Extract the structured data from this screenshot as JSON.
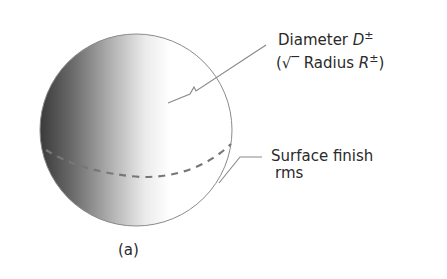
{
  "figure": {
    "caption": "(a)",
    "colors": {
      "outline": "#8a8a8a",
      "shade_dark": "#3c3c3c",
      "shade_light": "#ffffff",
      "dash": "#7a7a7a",
      "text": "#2a2a2a"
    },
    "sphere": {
      "center_x": 136,
      "center_y": 130,
      "radius": 96
    },
    "annotations": [
      {
        "id": "diameter",
        "line1_prefix": "Diameter ",
        "line1_symbol": "D",
        "line1_superscript": "±",
        "line2_open": "(",
        "line2_check": "√‾",
        "line2_text": " Radius ",
        "line2_symbol": "R",
        "line2_superscript": "±",
        "line2_close": ")"
      },
      {
        "id": "surface-finish",
        "line1": "Surface finish",
        "line2": "rms"
      }
    ]
  }
}
